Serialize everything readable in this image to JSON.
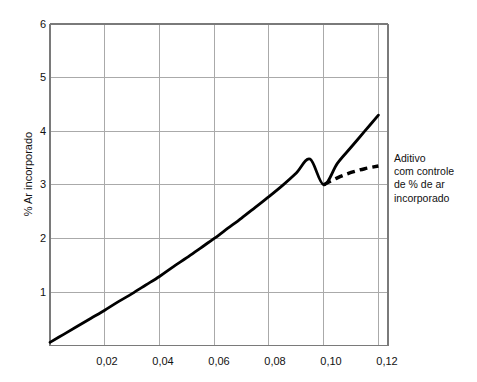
{
  "chart_data": {
    "type": "line",
    "title": "",
    "subtitle": "",
    "xlabel": "",
    "ylabel": "% Ar incorporado",
    "xlim": [
      0,
      0.1235
    ],
    "ylim": [
      0,
      6
    ],
    "grid": true,
    "legend_position": "right-inline-annotation",
    "x_tick_labels": [
      "0,02",
      "0,04",
      "0,06",
      "0,08",
      "0,10",
      "0,12"
    ],
    "x_tick_values": [
      0.02,
      0.04,
      0.06,
      0.08,
      0.1,
      0.12
    ],
    "y_tick_labels": [
      "1",
      "2",
      "3",
      "4",
      "5",
      "6"
    ],
    "y_tick_values": [
      1,
      2,
      3,
      4,
      5,
      6
    ],
    "series": [
      {
        "name": "Aditivo sem controle",
        "style": "solid",
        "color": "#000000",
        "x": [
          0.0,
          0.005,
          0.01,
          0.015,
          0.02,
          0.025,
          0.03,
          0.035,
          0.04,
          0.045,
          0.05,
          0.055,
          0.06,
          0.065,
          0.07,
          0.075,
          0.08,
          0.085,
          0.09,
          0.095,
          0.1,
          0.105,
          0.11,
          0.115,
          0.12
        ],
        "values": [
          0.06,
          0.21,
          0.36,
          0.51,
          0.66,
          0.82,
          0.97,
          1.13,
          1.29,
          1.47,
          1.64,
          1.82,
          2.0,
          2.19,
          2.38,
          2.58,
          2.78,
          2.99,
          3.22,
          3.48,
          3.0,
          3.4,
          3.7,
          4.0,
          4.3
        ]
      },
      {
        "name": "Aditivo com controle de % de ar incorporado",
        "style": "dashed",
        "color": "#000000",
        "x": [
          0.1,
          0.105,
          0.11,
          0.115,
          0.12
        ],
        "values": [
          3.0,
          3.13,
          3.23,
          3.3,
          3.35
        ]
      }
    ],
    "annotations": [
      {
        "name": "dashed-series-annotation",
        "lines": [
          "Aditivo",
          "com controle",
          "de % de ar",
          "incorporado"
        ],
        "anchor_x": 0.122,
        "anchor_y": 3.35
      }
    ],
    "colors": {
      "curve": "#000000",
      "grid": "#aaaaaa",
      "axis": "#7a7a7a",
      "text": "#111111",
      "background": "#ffffff"
    }
  }
}
